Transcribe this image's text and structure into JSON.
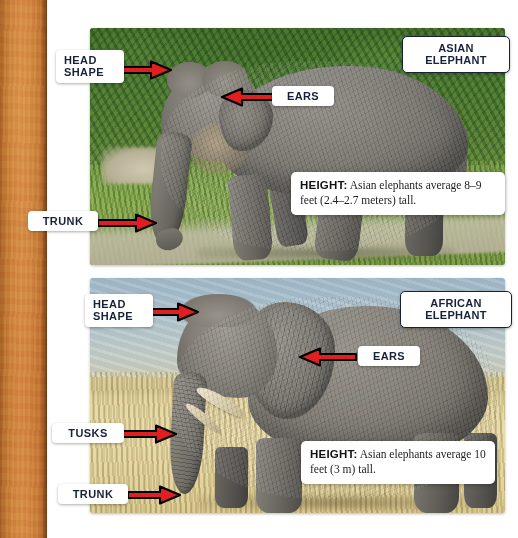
{
  "page": {
    "background_color": "#ffffff",
    "binding_color": "#d08640"
  },
  "panels": [
    {
      "id": "asian",
      "species_badge": "ASIAN\nELEPHANT",
      "scene": "Asian elephant walking on a dirt path in front of dense green jungle foliage and grass",
      "fact": {
        "key": "HEIGHT",
        "separator": ":",
        "text": "Asian elephants average 8–9 feet (2.4–2.7 meters) tall."
      },
      "callouts": [
        {
          "label": "HEAD\nSHAPE",
          "arrow": "right"
        },
        {
          "label": "EARS",
          "arrow": "left"
        },
        {
          "label": "TRUNK",
          "arrow": "right"
        }
      ]
    },
    {
      "id": "african",
      "species_badge": "AFRICAN\nELEPHANT",
      "scene": "African elephant standing in dry golden savanna grass under a pale blue sky",
      "fact": {
        "key": "HEIGHT",
        "separator": ":",
        "text": "Asian elephants average 10 feet (3 m) tall."
      },
      "callouts": [
        {
          "label": "HEAD\nSHAPE",
          "arrow": "right"
        },
        {
          "label": "EARS",
          "arrow": "left"
        },
        {
          "label": "TUSKS",
          "arrow": "right"
        },
        {
          "label": "TRUNK",
          "arrow": "right"
        }
      ]
    }
  ],
  "colors": {
    "arrow_fill": "#e02020",
    "arrow_stroke": "#000000",
    "label_text": "#17213a",
    "label_bg": "#ffffff",
    "badge_border": "#17213a"
  }
}
